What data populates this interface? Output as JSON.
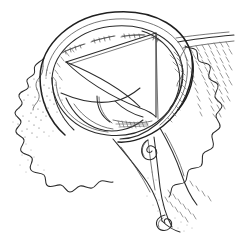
{
  "figure": {
    "domain": "Natural-Image",
    "kind": "vintage-engraving-illustration",
    "caption": "",
    "style": "line-engraving, cross-hatch and stipple shading, black ink on white",
    "background_color": "#ffffff",
    "ink_color": "#2b2b2b",
    "fine_ink_color": "#585858",
    "canvas": {
      "width": 235,
      "height": 235
    },
    "parts": [
      {
        "name": "outer-ring-band",
        "label": "Thick curved band forming the upper ring"
      },
      {
        "name": "ring-aperture",
        "label": "Open circular aperture beneath the band"
      },
      {
        "name": "triangular-flap",
        "label": "Large triangular flap drawn inside the aperture"
      },
      {
        "name": "inner-fold-curves",
        "label": "Curved folds crossing the lower aperture"
      },
      {
        "name": "suture-marks",
        "label": "Short stitch marks along the upper inner rim"
      },
      {
        "name": "left-scalloped-edge",
        "label": "Wavy scalloped tissue margin at the left"
      },
      {
        "name": "right-scalloped-edge",
        "label": "Wavy scalloped tissue margin at the right"
      },
      {
        "name": "lower-pendant-lobe",
        "label": "Pendant lobe descending below the ring"
      },
      {
        "name": "spiral-detail",
        "label": "Small coiled spiral detail near the lower centre"
      },
      {
        "name": "lower-spiral-detail",
        "label": "Second coiled spiral detail at the lower right"
      },
      {
        "name": "stipple-shading",
        "label": "Stippled shading field on the surrounding tissue"
      },
      {
        "name": "hatch-shading",
        "label": "Cross-hatch shading along the right margin"
      }
    ],
    "labels": []
  }
}
